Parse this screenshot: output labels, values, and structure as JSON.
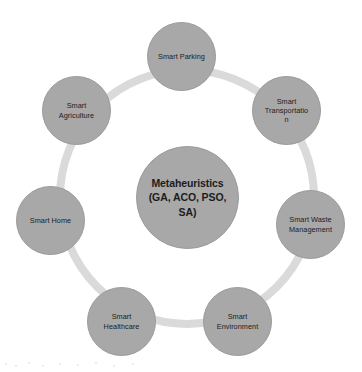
{
  "diagram": {
    "type": "cycle",
    "background_color": "#ffffff",
    "ring": {
      "color": "#dadada",
      "center_x": 187,
      "center_y": 197,
      "radius": 131,
      "thickness": 8
    },
    "node_fill_color": "#a8a8a8",
    "node_border_color": "#9a9a9a",
    "text_color": "#1c1c1c",
    "center_node": {
      "label": "Metaheuristics\n(GA, ACO, PSO,\nSA)",
      "radius": 51
    },
    "satellites": [
      {
        "label": "Smart Parking",
        "radius": 34,
        "angle_deg": -90
      },
      {
        "label": "Smart\nTransportatio\nn",
        "radius": 34,
        "angle_deg": -39
      },
      {
        "label": "Smart  Waste\nManagement",
        "radius": 34,
        "angle_deg": 13
      },
      {
        "label": "Smart\nEnvironment",
        "radius": 34,
        "angle_deg": 64
      },
      {
        "label": "Smart\nHealthcare",
        "radius": 34,
        "angle_deg": 116
      },
      {
        "label": "Smart Home",
        "radius": 34,
        "angle_deg": 167
      },
      {
        "label": "Smart\nAgriculture",
        "radius": 34,
        "angle_deg": -141
      }
    ]
  }
}
